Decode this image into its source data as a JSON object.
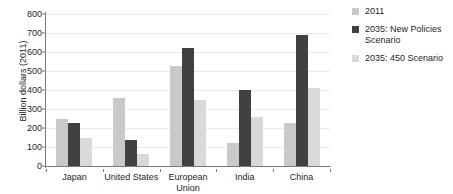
{
  "chart_data": {
    "type": "bar",
    "title": "",
    "xlabel": "",
    "ylabel": "Billion dollars (2011)",
    "ylim": [
      0,
      800
    ],
    "ytick_step": 100,
    "yticks": [
      "800",
      "700",
      "600",
      "500",
      "400",
      "300",
      "200",
      "100",
      "0"
    ],
    "grid": true,
    "legend_position": "right",
    "categories": [
      "Japan",
      "United States",
      "European Union",
      "India",
      "China"
    ],
    "series": [
      {
        "name": "2011",
        "color": "#c9c9c9",
        "values": [
          250,
          360,
          525,
          120,
          225
        ]
      },
      {
        "name": "2035: New Policies Scenario",
        "color": "#414141",
        "values": [
          225,
          135,
          620,
          400,
          690
        ]
      },
      {
        "name": "2035: 450 Scenario",
        "color": "#d9d9d9",
        "values": [
          150,
          65,
          345,
          260,
          410
        ]
      }
    ]
  },
  "legend": {
    "items": [
      {
        "label": "2011"
      },
      {
        "label": "2035: New Policies Scenario"
      },
      {
        "label": "2035: 450 Scenario"
      }
    ]
  },
  "colors": {
    "series_2011": "#c9c9c9",
    "series_new_policies": "#414141",
    "series_450": "#d9d9d9",
    "axis": "#7a7a7a",
    "gridline": "#e9e9e9",
    "text": "#231f20",
    "background": "#ffffff"
  }
}
